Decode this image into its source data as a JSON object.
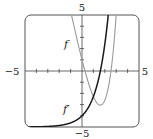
{
  "chart_data": {
    "type": "line",
    "title": "",
    "xlabel": "",
    "ylabel": "",
    "xlim": [
      -5,
      5
    ],
    "ylim": [
      -5,
      5
    ],
    "grid": false,
    "legend": "none (inline curve labels)",
    "tick_step": 1,
    "tick_labels": {
      "x_min": "−5",
      "x_max": "5",
      "y_min": "−5",
      "y_max": "5"
    },
    "series": [
      {
        "name": "f",
        "label": "f",
        "expression": "e^x - 5x",
        "color": "#9a9a9a",
        "x": [
          -0.92,
          -0.5,
          0,
          0.5,
          1.0,
          1.61,
          2.0,
          2.5,
          2.98
        ],
        "y": [
          5.0,
          3.11,
          1.0,
          -0.85,
          -2.28,
          -3.05,
          -2.61,
          -0.32,
          5.0
        ]
      },
      {
        "name": "f'",
        "label": "f′",
        "expression": "e^x - 5",
        "color": "#1a1a1a",
        "x": [
          -5,
          -4,
          -3,
          -2,
          -1,
          0,
          0.5,
          1.0,
          1.61,
          2.0,
          2.3
        ],
        "y": [
          -4.99,
          -4.98,
          -4.95,
          -4.86,
          -4.63,
          -4.0,
          -3.35,
          -2.28,
          0.0,
          2.39,
          5.0
        ]
      }
    ],
    "annotations": [
      {
        "text": "f",
        "x": -0.6,
        "y": 2.0
      },
      {
        "text": "f′",
        "x": -0.75,
        "y": -3.6
      }
    ]
  }
}
